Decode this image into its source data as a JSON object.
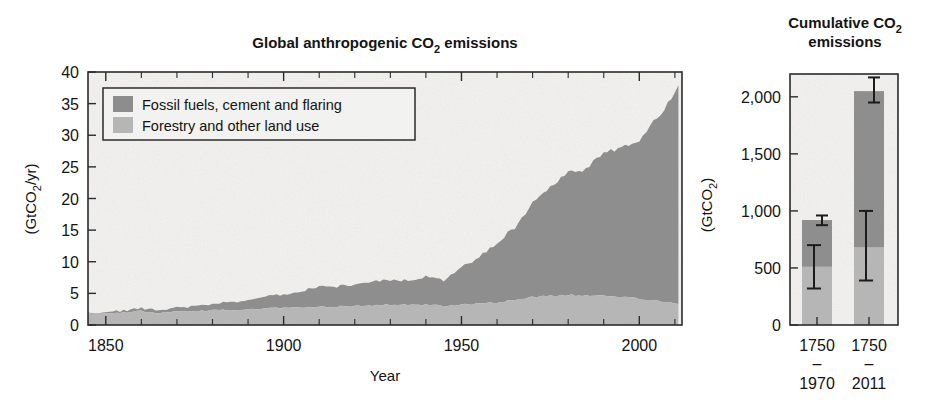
{
  "figure": {
    "background_color": "#ffffff",
    "series_colors": {
      "fossil": "#8d8d8d",
      "forestry": "#b6b6b6",
      "plot_background": "#f2f1ef",
      "axis": "#2b2b2b"
    }
  },
  "left_panel": {
    "title_line1": "Global anthropogenic CO",
    "title_sub": "2",
    "title_line2": " emissions",
    "title_full": "Global anthropogenic CO2 emissions",
    "ylabel_pre": "(GtCO",
    "ylabel_sub": "2",
    "ylabel_post": "/yr)",
    "xlabel": "Year",
    "y_ticks": [
      "0",
      "5",
      "10",
      "15",
      "20",
      "25",
      "30",
      "35",
      "40"
    ],
    "x_ticks": [
      "1850",
      "1900",
      "1950",
      "2000"
    ],
    "legend": [
      {
        "label": "Fossil fuels, cement and flaring",
        "color": "#8d8d8d",
        "key": "fossil"
      },
      {
        "label": "Forestry and other land use",
        "color": "#b6b6b6",
        "key": "forestry"
      }
    ]
  },
  "right_panel": {
    "title_line1": "Cumulative CO",
    "title_sub": "2",
    "title_line2": "emissions",
    "title_full": "Cumulative CO2 emissions",
    "ylabel_pre": "(GtCO",
    "ylabel_sub": "2",
    "ylabel_post": ")",
    "y_ticks": [
      "0",
      "500",
      "1,000",
      "1,500",
      "2,000"
    ],
    "x_tick_groups": [
      {
        "start": "1750",
        "dash": "–",
        "end": "1970"
      },
      {
        "start": "1750",
        "dash": "–",
        "end": "2011"
      }
    ]
  },
  "chart_data": [
    {
      "type": "area",
      "id": "global-anthropogenic-co2-emissions",
      "title": "Global anthropogenic CO2 emissions",
      "xlabel": "Year",
      "ylabel": "(GtCO2/yr)",
      "xlim": [
        1845,
        2012
      ],
      "ylim": [
        0,
        40
      ],
      "ytick_step": 5,
      "xticks": [
        1850,
        1900,
        1950,
        2000
      ],
      "yticks": [
        0,
        5,
        10,
        15,
        20,
        25,
        30,
        35,
        40
      ],
      "grid": false,
      "stacked": true,
      "legend_position": "upper-left-inside",
      "x": [
        1850,
        1855,
        1860,
        1865,
        1870,
        1875,
        1880,
        1885,
        1890,
        1895,
        1900,
        1905,
        1910,
        1915,
        1920,
        1925,
        1930,
        1935,
        1940,
        1945,
        1950,
        1955,
        1960,
        1965,
        1970,
        1975,
        1980,
        1985,
        1990,
        1995,
        2000,
        2005,
        2010,
        2011
      ],
      "series": [
        {
          "name": "Forestry and other land use",
          "color": "#b6b6b6",
          "values": [
            1.8,
            2.0,
            2.2,
            1.9,
            2.1,
            2.2,
            2.3,
            2.4,
            2.5,
            2.6,
            2.7,
            2.8,
            2.9,
            2.9,
            3.0,
            3.1,
            3.2,
            3.2,
            3.2,
            3.0,
            3.2,
            3.4,
            3.6,
            3.9,
            4.4,
            4.6,
            4.8,
            4.6,
            4.6,
            4.4,
            4.2,
            3.9,
            3.5,
            3.4
          ]
        },
        {
          "name": "Fossil fuels, cement and flaring",
          "color": "#8d8d8d",
          "values": [
            0.2,
            0.3,
            0.4,
            0.5,
            0.6,
            0.8,
            1.0,
            1.2,
            1.5,
            1.8,
            2.1,
            2.6,
            3.2,
            3.2,
            3.4,
            3.8,
            3.9,
            3.8,
            4.4,
            4.0,
            5.9,
            7.4,
            9.4,
            11.5,
            14.8,
            17.0,
            19.5,
            20.0,
            22.7,
            23.5,
            25.0,
            29.0,
            33.0,
            34.5
          ]
        }
      ],
      "total_2011": 38.0,
      "notes": "Stacked area: forestry/land use at base, fossil fuels stacked on top; total peaks near 38 GtCO2/yr in 2011."
    },
    {
      "type": "bar",
      "id": "cumulative-co2-emissions",
      "title": "Cumulative CO2 emissions",
      "xlabel": "",
      "ylabel": "(GtCO2)",
      "ylim": [
        0,
        2200
      ],
      "yticks": [
        0,
        500,
        1000,
        1500,
        2000
      ],
      "grid": false,
      "stacked": true,
      "categories": [
        "1750–1970",
        "1750–2011"
      ],
      "series": [
        {
          "name": "Forestry and other land use",
          "color": "#b6b6b6",
          "values": [
            510,
            680
          ]
        },
        {
          "name": "Fossil fuels, cement and flaring",
          "color": "#8d8d8d",
          "values": [
            410,
            1370
          ]
        }
      ],
      "totals": [
        920,
        2050
      ],
      "error_bars": [
        {
          "category": "1750–1970",
          "series": "total",
          "value": 920,
          "low": 875,
          "high": 960
        },
        {
          "category": "1750–1970",
          "series": "forestry",
          "value": 510,
          "low": 320,
          "high": 700
        },
        {
          "category": "1750–2011",
          "series": "total",
          "value": 2050,
          "low": 1950,
          "high": 2170
        },
        {
          "category": "1750–2011",
          "series": "forestry",
          "value": 680,
          "low": 390,
          "high": 1000
        }
      ]
    }
  ]
}
